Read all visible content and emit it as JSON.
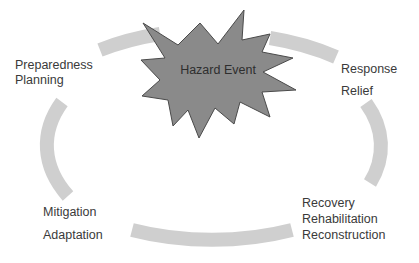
{
  "diagram": {
    "type": "disaster-management-cycle",
    "center_event": {
      "label": "Hazard Event",
      "shape": "starburst",
      "fill": "#8a8a8a",
      "stroke": "#4a4a4a"
    },
    "cycle_color": "#cfcfcf",
    "phases": [
      {
        "id": "response",
        "lines": [
          "Response",
          "Relief"
        ]
      },
      {
        "id": "recovery",
        "lines": [
          "Recovery",
          "Rehabilitation",
          "Reconstruction"
        ]
      },
      {
        "id": "mitigation",
        "lines": [
          "Mitigation",
          "Adaptation"
        ]
      },
      {
        "id": "preparedness",
        "lines": [
          "Preparedness",
          "Planning"
        ]
      }
    ]
  }
}
